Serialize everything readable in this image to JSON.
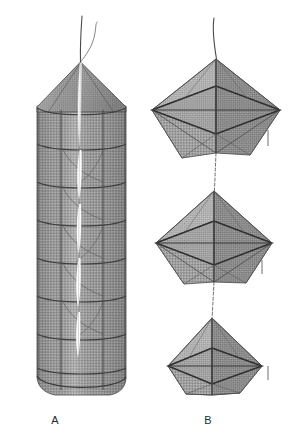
{
  "figure": {
    "background_color": "#ffffff",
    "ink_color": "#333333",
    "mesh_color": "#9a9a9a",
    "mesh_color_light": "#b6b6b6",
    "mesh_color_dark": "#6f6f6f",
    "width": 288,
    "height": 443
  },
  "panels": [
    {
      "id": "panel-a",
      "label": "A",
      "label_x": 55,
      "label_y": 424,
      "description": "Cylindrical hoop net trap with conical top, vertical suspension line, horizontal hoop rings and a vertical slit opening",
      "shape": "cylindrical-hoop-net",
      "center_x": 81,
      "top_y": 16,
      "bottom_y": 396,
      "body_left": 37,
      "body_right": 126,
      "cone_apex_y": 62,
      "cone_base_y": 108,
      "hoop_count": 8,
      "slit_count": 4
    },
    {
      "id": "panel-b",
      "label": "B",
      "label_x": 208,
      "label_y": 424,
      "description": "Three stacked diamond (bipyramid) net traps joined by a vertical line",
      "shape": "stacked-diamond-nets",
      "center_x": 216,
      "top_y": 18,
      "bottom_y": 396,
      "trap_count": 3,
      "traps": [
        {
          "id": "trap-b1",
          "cy": 106,
          "half_w": 64,
          "half_h": 47,
          "rim_y": 110
        },
        {
          "id": "trap-b2",
          "cy": 238,
          "half_w": 58,
          "half_h": 44,
          "rim_y": 243
        },
        {
          "id": "trap-b3",
          "cy": 360,
          "half_w": 50,
          "half_h": 40,
          "rim_y": 366
        }
      ]
    }
  ],
  "labels": {
    "a": "A",
    "b": "B"
  }
}
